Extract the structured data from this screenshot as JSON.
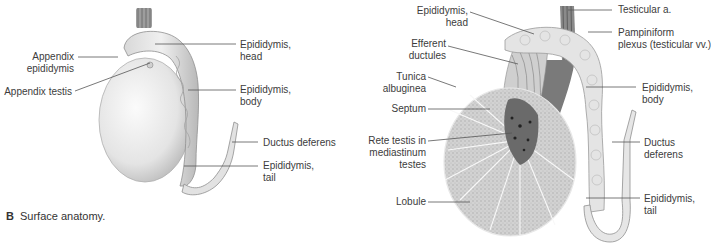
{
  "figure_left": {
    "caption_letter": "B",
    "caption_text": "Surface anatomy.",
    "labels": {
      "appendix_epididymis": "Appendix\nepididymis",
      "appendix_testis": "Appendix testis",
      "epididymis_head": "Epididymis,\nhead",
      "epididymis_body": "Epididymis,\nbody",
      "ductus_deferens": "Ductus deferens",
      "epididymis_tail": "Epididymis,\ntail"
    }
  },
  "figure_right": {
    "labels": {
      "epididymis_head": "Epididymis,\nhead",
      "efferent_ductules": "Efferent\nductules",
      "tunica_albuginea": "Tunica\nalbuginea",
      "septum": "Septum",
      "rete_testis": "Rete testis in\nmediastinum\ntestes",
      "lobule": "Lobule",
      "testicular_artery": "Testicular a.",
      "pampiniform_plexus": "Pampiniform\nplexus (testicular vv.)",
      "epididymis_body": "Epididymis,\nbody",
      "ductus_deferens": "Ductus\ndeferens",
      "epididymis_tail": "Epididymis,\ntail"
    }
  },
  "colors": {
    "leader_line": "#555555",
    "tissue_light": "#e6e6e6",
    "tissue_dark": "#9a9a9a"
  }
}
